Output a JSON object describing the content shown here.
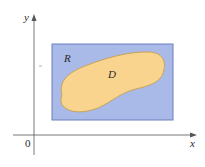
{
  "diagram": {
    "axes": {
      "x_label": "x",
      "y_label": "y",
      "origin_label": "0"
    },
    "regions": {
      "rectangle_label": "R",
      "domain_label": "D"
    },
    "colors": {
      "rectangle_fill": "#a9b9e8",
      "rectangle_stroke": "#6c7fbf",
      "domain_fill": "#f8d48e",
      "domain_stroke": "#c9a458",
      "axis": "#555555"
    }
  }
}
